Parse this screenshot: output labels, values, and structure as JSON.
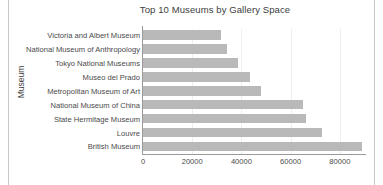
{
  "chart_data": {
    "type": "bar",
    "orientation": "horizontal",
    "title": "Top 10 Museums by Gallery Space",
    "xlabel": "",
    "ylabel": "Museum",
    "categories": [
      "Victoria and Albert Museum",
      "National Museum of Anthropology",
      "Tokyo National Museums",
      "Museo del Prado",
      "Metropolitan Museum of Art",
      "National Museum of China",
      "State Hermitage Museum",
      "Louvre",
      "British Museum"
    ],
    "values": [
      31600,
      34300,
      38600,
      43600,
      48100,
      64800,
      66400,
      72900,
      88800
    ],
    "xlim": [
      0,
      90600
    ],
    "xticks": [
      0,
      20000,
      40000,
      60000,
      80000
    ],
    "xtick_labels": [
      "0",
      "20000",
      "40000",
      "60000",
      "80000"
    ],
    "grid": "vertical",
    "legend": "none",
    "bar_color": "#b9b9b9",
    "gridline_color": "#eeeeee",
    "axis_color": "#9a9a9a",
    "text_color": "#4a4a4a",
    "background": "#ffffff"
  }
}
